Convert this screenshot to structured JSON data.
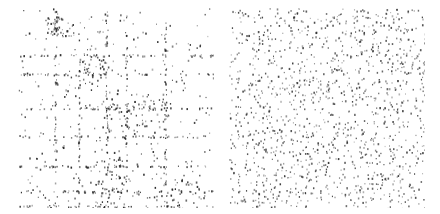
{
  "chart_data": [
    {
      "type": "scatter",
      "subtype": "sparsity-pattern",
      "title": "",
      "xlabel": "",
      "ylabel": "",
      "grid": false,
      "legend": null,
      "description": "Structured sparse matrix: nonzeros clustered in row/column bands and dense blocks",
      "size": 200,
      "seed": 7,
      "background_points": 260,
      "row_bands": [
        47,
        66,
        100,
        128,
        158,
        183,
        198
      ],
      "col_bands": [
        38,
        62,
        90,
        110,
        150
      ],
      "band_points": 40,
      "dense_blocks": [
        {
          "x": 28,
          "y": 8,
          "w": 30,
          "h": 22,
          "n": 45
        },
        {
          "x": 64,
          "y": 45,
          "w": 24,
          "h": 30,
          "n": 40
        },
        {
          "x": 84,
          "y": 85,
          "w": 70,
          "h": 40,
          "n": 90
        },
        {
          "x": 78,
          "y": 150,
          "w": 30,
          "h": 50,
          "n": 70
        },
        {
          "x": 130,
          "y": 170,
          "w": 60,
          "h": 25,
          "n": 40
        }
      ],
      "color": "#222222"
    },
    {
      "type": "scatter",
      "subtype": "sparsity-pattern",
      "title": "",
      "xlabel": "",
      "ylabel": "",
      "grid": false,
      "legend": null,
      "description": "Randomly permuted sparse matrix: nonzeros uniformly scattered",
      "size": 200,
      "seed": 19,
      "background_points": 1350,
      "row_bands": [],
      "col_bands": [],
      "band_points": 0,
      "dense_blocks": [],
      "color": "#333333"
    }
  ]
}
